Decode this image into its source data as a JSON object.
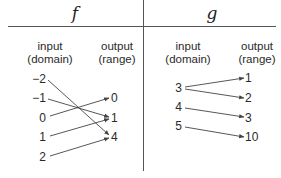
{
  "table": {
    "f": {
      "name": "f",
      "input_header": "input",
      "input_sub": "(domain)",
      "output_header": "output",
      "output_sub": "(range)",
      "inputs": [
        "−2",
        "−1",
        "0",
        "1",
        "2"
      ],
      "outputs": [
        "0",
        "1",
        "4"
      ],
      "mappings": [
        [
          "−2",
          "4"
        ],
        [
          "−1",
          "1"
        ],
        [
          "0",
          "0"
        ],
        [
          "1",
          "1"
        ],
        [
          "2",
          "4"
        ]
      ]
    },
    "g": {
      "name": "g",
      "input_header": "input",
      "input_sub": "(domain)",
      "output_header": "output",
      "output_sub": "(range)",
      "inputs": [
        "3",
        "4",
        "5"
      ],
      "outputs": [
        "1",
        "2",
        "3",
        "10"
      ],
      "mappings": [
        [
          "3",
          "1"
        ],
        [
          "3",
          "2"
        ],
        [
          "4",
          "3"
        ],
        [
          "5",
          "10"
        ]
      ]
    }
  },
  "colors": {
    "line": "#444444",
    "text": "#2a2a2a"
  }
}
